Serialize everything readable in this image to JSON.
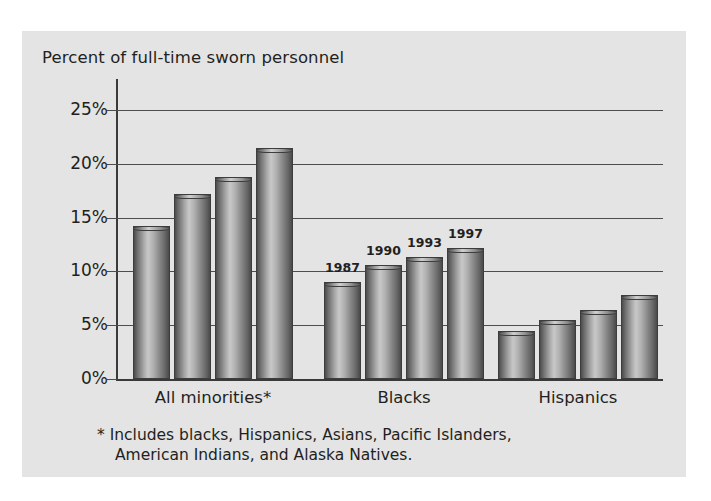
{
  "page": {
    "scan_artifact_text": ""
  },
  "figure": {
    "title": "Percent of full-time sworn personnel",
    "footnote_line1": "* Includes blacks, Hispanics, Asians, Pacific Islanders,",
    "footnote_line2": "American Indians, and Alaska Natives.",
    "panel_bg": "#e4e4e4",
    "ink": "#231f20"
  },
  "chart_data": {
    "type": "bar",
    "title": "Percent of full-time sworn personnel",
    "xlabel": "",
    "ylabel": "Percent of full-time sworn personnel",
    "ylim": [
      0,
      25
    ],
    "yticks": [
      0,
      5,
      10,
      15,
      20,
      25
    ],
    "ytick_labels": [
      "0%",
      "5%",
      "10%",
      "15%",
      "20%",
      "25%"
    ],
    "grid": true,
    "grid_axis": "y",
    "legend": "in-plot bar labels",
    "legend_position": "above bars of second group",
    "categories": [
      "All minorities*",
      "Blacks",
      "Hispanics"
    ],
    "series": [
      {
        "name": "1987",
        "values": [
          14.2,
          9.0,
          4.5
        ]
      },
      {
        "name": "1990",
        "values": [
          17.2,
          10.6,
          5.5
        ]
      },
      {
        "name": "1993",
        "values": [
          18.8,
          11.3,
          6.4
        ]
      },
      {
        "name": "1997",
        "values": [
          21.5,
          12.2,
          7.8
        ]
      }
    ],
    "bar_labels_group_index": 1,
    "annotations": [
      "* Includes blacks, Hispanics, Asians, Pacific Islanders, American Indians, and Alaska Natives."
    ]
  }
}
